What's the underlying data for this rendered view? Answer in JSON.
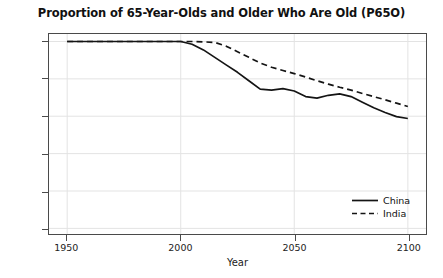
{
  "chart_data": {
    "type": "line",
    "title": "Proportion of 65-Year-Olds and Older Who Are Old (P65O)",
    "xlabel": "Year",
    "ylabel": "Proportion",
    "xlim": [
      1942,
      2108
    ],
    "ylim": [
      -0.03,
      1.04
    ],
    "xticks": [
      1950,
      2000,
      2050,
      2100
    ],
    "yticks": [
      0.0,
      0.2,
      0.4,
      0.6,
      0.8,
      1.0
    ],
    "xticklabels": [
      "1950",
      "2000",
      "2050",
      "2100"
    ],
    "yticklabels": [
      "0.0",
      "0.2",
      "0.4",
      "0.6",
      "0.8",
      "1.0"
    ],
    "grid": true,
    "grid_color": "#e3e3e3",
    "legend_position": "lower right",
    "legend_frame": false,
    "series": [
      {
        "name": "China",
        "style": "solid",
        "color": "#141414",
        "x": [
          1950,
          1960,
          1970,
          1980,
          1990,
          1995,
          2000,
          2005,
          2010,
          2015,
          2020,
          2025,
          2030,
          2035,
          2040,
          2045,
          2050,
          2055,
          2060,
          2065,
          2070,
          2075,
          2080,
          2085,
          2090,
          2095,
          2100
        ],
        "values": [
          1.0,
          1.0,
          1.0,
          1.0,
          1.0,
          1.0,
          1.0,
          0.985,
          0.955,
          0.915,
          0.875,
          0.835,
          0.79,
          0.745,
          0.74,
          0.748,
          0.735,
          0.705,
          0.697,
          0.712,
          0.72,
          0.705,
          0.675,
          0.645,
          0.62,
          0.598,
          0.588
        ]
      },
      {
        "name": "India",
        "style": "dashed",
        "color": "#141414",
        "x": [
          1950,
          1960,
          1970,
          1980,
          1990,
          2000,
          2005,
          2010,
          2015,
          2020,
          2025,
          2030,
          2035,
          2040,
          2045,
          2050,
          2055,
          2060,
          2065,
          2070,
          2075,
          2080,
          2085,
          2090,
          2095,
          2100
        ],
        "values": [
          1.0,
          1.0,
          1.0,
          1.0,
          1.0,
          1.0,
          1.0,
          0.998,
          0.995,
          0.975,
          0.945,
          0.915,
          0.885,
          0.862,
          0.845,
          0.828,
          0.81,
          0.79,
          0.772,
          0.755,
          0.74,
          0.722,
          0.705,
          0.688,
          0.67,
          0.652
        ]
      }
    ]
  },
  "legend": {
    "items": [
      {
        "label": "China",
        "style": "solid"
      },
      {
        "label": "India",
        "style": "dashed"
      }
    ]
  }
}
